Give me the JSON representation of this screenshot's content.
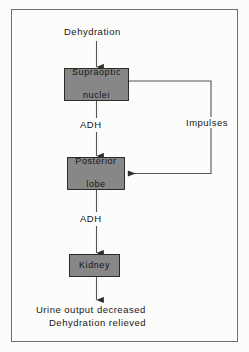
{
  "figure": {
    "type": "flowchart",
    "title_text": "Dehydration",
    "orientation": "vertical",
    "border_color": "#6f6f70",
    "box_fill_color": "#878787",
    "box_border_color": "#2b2b2b",
    "line_color": "#4a4a4a",
    "background_color": "#fcfcfb"
  },
  "nodes": {
    "start": {
      "label": "Dehydration",
      "kind": "text"
    },
    "supraoptic": {
      "line1": "Supraoptic",
      "line2": "nuclei",
      "kind": "box"
    },
    "posterior": {
      "line1": "Posterior",
      "line2": "lobe",
      "kind": "box"
    },
    "kidney": {
      "label": "Kidney",
      "kind": "box"
    },
    "outcome_line1": {
      "label": "Urine output decreased",
      "kind": "text"
    },
    "outcome_line2": {
      "label": "Dehydration relieved",
      "kind": "text"
    }
  },
  "edges": {
    "adh_upper": {
      "label": "ADH",
      "from": "supraoptic",
      "to": "posterior"
    },
    "adh_lower": {
      "label": "ADH",
      "from": "posterior",
      "to": "kidney"
    },
    "feedback": {
      "label": "Impulses",
      "from": "supraoptic",
      "to": "posterior",
      "routing": "right-side-loop"
    },
    "start_edge": {
      "label": "",
      "from": "start",
      "to": "supraoptic"
    },
    "outcome_edge": {
      "label": "",
      "from": "kidney",
      "to": "outcome_line1"
    }
  }
}
